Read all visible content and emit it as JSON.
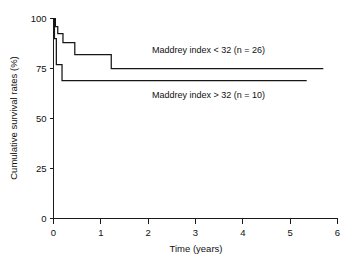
{
  "chart_data": {
    "type": "line",
    "subtype": "kaplan-meier-step",
    "title": "",
    "xlabel": "Time (years)",
    "ylabel": "Cumulative survival rates (%)",
    "xlim": [
      0,
      6
    ],
    "ylim": [
      0,
      100
    ],
    "xticks": [
      0,
      1,
      2,
      3,
      4,
      5,
      6
    ],
    "xtick_labels": [
      "0",
      "1",
      "2",
      "3",
      "4",
      "5",
      "6"
    ],
    "yticks": [
      0,
      25,
      50,
      75,
      100
    ],
    "ytick_labels": [
      "0",
      "25",
      "50",
      "75",
      "100"
    ],
    "grid": false,
    "legend_position": "inline-annotation",
    "series": [
      {
        "name": "Maddrey index < 32 (n = 26)",
        "label": "Maddrey index < 32 (n = 26)",
        "n": 26,
        "final_survival": 75,
        "color": "#161616",
        "x": [
          0.0,
          0.04,
          0.04,
          0.09,
          0.09,
          0.2,
          0.2,
          0.3,
          0.3,
          0.45,
          0.45,
          1.22,
          1.22,
          5.7
        ],
        "y": [
          100.0,
          100.0,
          96.0,
          96.0,
          92.5,
          92.5,
          88.0,
          88.0,
          88.0,
          88.0,
          82.0,
          82.0,
          75.0,
          75.0
        ]
      },
      {
        "name": "Maddrey index > 32 (n = 10)",
        "label": "Maddrey index > 32 (n = 10)",
        "n": 10,
        "final_survival": 69,
        "color": "#161616",
        "x": [
          0.0,
          0.02,
          0.02,
          0.06,
          0.06,
          0.18,
          0.18,
          5.35
        ],
        "y": [
          100.0,
          100.0,
          90.0,
          90.0,
          77.0,
          77.0,
          69.0,
          69.0
        ]
      }
    ],
    "annotations": [
      {
        "text": "Maddrey index < 32 (n = 26)",
        "x_px": 152,
        "y_px": 53
      },
      {
        "text": "Maddrey index > 32 (n = 10)",
        "x_px": 152,
        "y_px": 98
      }
    ]
  }
}
